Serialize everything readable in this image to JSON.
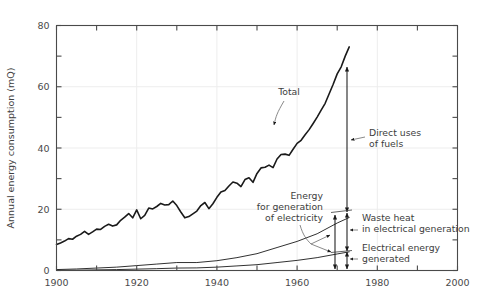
{
  "chart_data": {
    "type": "line",
    "title": "",
    "xlabel": "",
    "ylabel": "Annual energy consumption (mQ)",
    "xlim": [
      1900,
      2000
    ],
    "ylim": [
      0,
      80
    ],
    "grid": true,
    "legend_position": "none",
    "x_ticks_major": [
      "1900",
      "1920",
      "1940",
      "1960",
      "1980",
      "2000"
    ],
    "x_tick_values_major": [
      1900,
      1920,
      1940,
      1960,
      1980,
      2000
    ],
    "x_tick_values_minor": [
      1910,
      1930,
      1950,
      1970,
      1990
    ],
    "y_ticks_major": [
      "0",
      "20",
      "40",
      "60",
      "80"
    ],
    "y_tick_values_major": [
      0,
      20,
      40,
      60,
      80
    ],
    "y_tick_values_minor": [
      10,
      30,
      50,
      70
    ],
    "series": [
      {
        "name": "Total",
        "x": [
          1900,
          1901,
          1902,
          1903,
          1904,
          1905,
          1906,
          1907,
          1908,
          1909,
          1910,
          1911,
          1912,
          1913,
          1914,
          1915,
          1916,
          1917,
          1918,
          1919,
          1920,
          1921,
          1922,
          1923,
          1924,
          1925,
          1926,
          1927,
          1928,
          1929,
          1930,
          1931,
          1932,
          1933,
          1934,
          1935,
          1936,
          1937,
          1938,
          1939,
          1940,
          1941,
          1942,
          1943,
          1944,
          1945,
          1946,
          1947,
          1948,
          1949,
          1950,
          1951,
          1952,
          1953,
          1954,
          1955,
          1956,
          1957,
          1958,
          1959,
          1960,
          1961,
          1962,
          1963,
          1964,
          1965,
          1966,
          1967,
          1968,
          1969,
          1970,
          1971,
          1972,
          1973
        ],
        "values": [
          8.5,
          9.0,
          9.6,
          10.4,
          10.2,
          11.2,
          11.8,
          12.8,
          11.8,
          12.6,
          13.5,
          13.4,
          14.4,
          15.1,
          14.5,
          14.9,
          16.4,
          17.4,
          18.6,
          17.2,
          19.8,
          16.9,
          18.0,
          20.4,
          20.1,
          20.9,
          21.9,
          21.4,
          21.5,
          22.7,
          21.2,
          19.1,
          17.2,
          17.6,
          18.5,
          19.4,
          21.2,
          22.2,
          20.2,
          21.8,
          23.9,
          25.6,
          26.1,
          27.6,
          28.9,
          28.5,
          27.4,
          29.7,
          30.3,
          28.8,
          31.7,
          33.5,
          33.7,
          34.4,
          33.6,
          36.4,
          37.9,
          38.0,
          37.6,
          39.6,
          41.5,
          42.5,
          44.3,
          46.0,
          48.0,
          50.1,
          52.4,
          54.6,
          57.7,
          60.8,
          64.2,
          66.5,
          70.0,
          73.0
        ],
        "color": "#1a1a1a",
        "linewidth": 1.6
      },
      {
        "name": "Energy for generation of electricity",
        "x": [
          1900,
          1905,
          1910,
          1915,
          1920,
          1925,
          1930,
          1935,
          1940,
          1945,
          1950,
          1955,
          1960,
          1965,
          1970,
          1973
        ],
        "values": [
          0.3,
          0.5,
          0.8,
          1.1,
          1.6,
          2.1,
          2.6,
          2.6,
          3.2,
          4.2,
          5.5,
          7.5,
          9.5,
          12.0,
          15.5,
          17.3
        ],
        "color": "#1a1a1a",
        "linewidth": 0.9
      },
      {
        "name": "Electrical energy generated",
        "x": [
          1900,
          1905,
          1910,
          1915,
          1920,
          1925,
          1930,
          1935,
          1940,
          1945,
          1950,
          1955,
          1960,
          1965,
          1970,
          1973
        ],
        "values": [
          0.05,
          0.1,
          0.2,
          0.3,
          0.45,
          0.6,
          0.8,
          0.85,
          1.1,
          1.5,
          1.9,
          2.6,
          3.3,
          4.2,
          5.4,
          6.1
        ],
        "color": "#1a1a1a",
        "linewidth": 0.9
      }
    ],
    "annotations": [
      {
        "id": "total",
        "text": "Total",
        "lines": [
          "Total"
        ],
        "anchor": "start"
      },
      {
        "id": "direct-uses-of-fuels",
        "text": "Direct uses of fuels",
        "lines": [
          "Direct uses",
          "of fuels"
        ],
        "anchor": "start"
      },
      {
        "id": "energy-for-generation-of-electricity",
        "text": "Energy for generation of electricity",
        "lines": [
          "Energy",
          "for generation",
          "of electricity"
        ],
        "anchor": "end"
      },
      {
        "id": "waste-heat-in-electrical-generation",
        "text": "Waste heat in electrical generation",
        "lines": [
          "Waste heat",
          "in electrical generation"
        ],
        "anchor": "start"
      },
      {
        "id": "electrical-energy-generated",
        "text": "Electrical energy generated",
        "lines": [
          "Electrical energy",
          "generated"
        ],
        "anchor": "start"
      }
    ],
    "colors": {
      "line": "#1a1a1a",
      "axis": "#4a4a4a",
      "grid": "#ededed",
      "text": "#3d3d3d",
      "background": "#ffffff"
    }
  }
}
